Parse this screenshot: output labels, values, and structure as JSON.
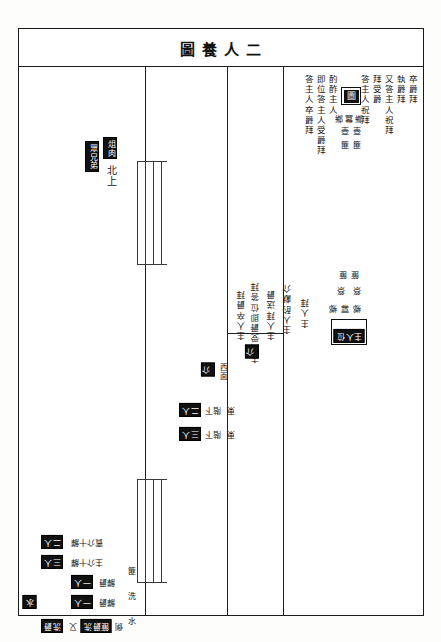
{
  "title": "圖養人二",
  "frame": {
    "border_color": "#1b1b1b",
    "background": "#ffffff"
  },
  "chip_color": "#111111",
  "top_right_annotations": [
    {
      "text": "卒爵拜"
    },
    {
      "text": "執爵拜"
    },
    {
      "text": "又答主人祝拜"
    },
    {
      "text": "拜受爵"
    },
    {
      "text": "答主人祝拜"
    },
    {
      "text": "酌酢主人"
    },
    {
      "text": "即位答主人受爵拜"
    },
    {
      "text": "答主人卒爵拜"
    }
  ],
  "top_right_glyph": "圖",
  "top_right_small_grid": [
    [
      "鄉",
      "冪",
      "鄉"
    ],
    [
      "壺",
      "壺"
    ],
    [
      "篚",
      "篚"
    ]
  ],
  "mid_right_annotations": [
    {
      "text": "主人"
    },
    {
      "text": "主人卒爵拜"
    },
    {
      "text": "受爵即位答拜"
    },
    {
      "text": "主人拜送爵"
    },
    {
      "text": "主人酌獻介"
    },
    {
      "text": "主人answer"
    }
  ],
  "mid_right_columns": [
    "主人卒爵拜",
    "主人受爵即位答拜",
    "主人拜送爵",
    "主人酌獻介",
    "主人拜"
  ],
  "mid_right_small_grid": [
    [
      "篚",
      "篚"
    ],
    [
      "祭",
      "祭"
    ],
    [
      "鄉",
      "冪",
      "鄉"
    ]
  ],
  "mid_right_boxed_label": "主人位",
  "mid_right_chip": "介",
  "center_labels": [
    {
      "chip": "介",
      "note": "西面"
    },
    {
      "chip": "二人",
      "note": "階下",
      "aux": "東"
    },
    {
      "chip": "三人",
      "note": "階下",
      "aux": "東"
    }
  ],
  "upper_left_labels": [
    {
      "chip": "眾兄弟"
    },
    {
      "chip": "俎肉"
    },
    {
      "text": "北上"
    }
  ],
  "lower_left_labels": [
    {
      "chip": "二人",
      "note": "賓介十觶"
    },
    {
      "chip": "三人",
      "note": "主介十觶"
    },
    {
      "chip": "一人",
      "note": "觶爵"
    },
    {
      "chip": "一人",
      "note": "觶爵"
    },
    {
      "chip": "洗爵",
      "note": "又",
      "chip2": "篚爵洗",
      "aux": "側"
    },
    {
      "chip_side": "水"
    }
  ],
  "lower_left_vertical": "篚 洗 水",
  "stairs": [
    {
      "name": "upper-stair",
      "rails": 4
    },
    {
      "name": "lower-stair",
      "rails": 4
    }
  ]
}
